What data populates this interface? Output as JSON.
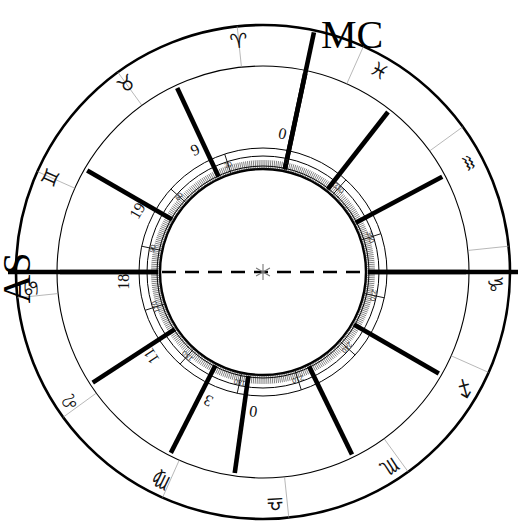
{
  "chart": {
    "type": "astrological-wheel",
    "center": {
      "x": 263,
      "y": 272,
      "marker": "asterisk"
    },
    "radii": {
      "outer_rim": 247,
      "zodiac_inner": 206,
      "house_ring_outer": 124,
      "degree_scale_outer": 116,
      "degree_scale_inner": 106,
      "inner_circle": 103
    },
    "axes": [
      {
        "name": "MC",
        "label": "MC",
        "angle_deg": 78,
        "position": "top"
      },
      {
        "name": "AS",
        "label": "AS",
        "angle_deg": 180,
        "position": "left"
      }
    ],
    "axis_line": {
      "name": "ascendant-descendant-axis",
      "style": "dashed",
      "from_angle_deg": 180,
      "to_angle_deg": 0
    },
    "zodiac_signs": [
      {
        "name": "aries",
        "glyph": "♈",
        "label": "Aries",
        "angle_deg": 96
      },
      {
        "name": "taurus",
        "glyph": "♉",
        "label": "Taurus",
        "angle_deg": 126
      },
      {
        "name": "gemini",
        "glyph": "♊",
        "label": "Gemini",
        "angle_deg": 156
      },
      {
        "name": "cancer",
        "glyph": "♋",
        "label": "Cancer",
        "angle_deg": 184
      },
      {
        "name": "leo",
        "glyph": "♌",
        "label": "Leo",
        "angle_deg": 214
      },
      {
        "name": "virgo",
        "glyph": "♍",
        "label": "Virgo",
        "angle_deg": 244
      },
      {
        "name": "libra",
        "glyph": "♎",
        "label": "Libra",
        "angle_deg": 273
      },
      {
        "name": "scorpio",
        "glyph": "♏",
        "label": "Scorpio",
        "angle_deg": 303
      },
      {
        "name": "sagittarius",
        "glyph": "♐",
        "label": "Sagittarius",
        "angle_deg": 330
      },
      {
        "name": "capricorn",
        "glyph": "♑",
        "label": "Capricorn",
        "angle_deg": 357
      },
      {
        "name": "aquarius",
        "glyph": "♒",
        "label": "Aquarius",
        "angle_deg": 28
      },
      {
        "name": "pisces",
        "glyph": "♓",
        "label": "Pisces",
        "angle_deg": 60
      }
    ],
    "sign_boundaries_deg": [
      6,
      36,
      66,
      96,
      126,
      156,
      186,
      216,
      246,
      276,
      306,
      336
    ],
    "house_cusps": [
      {
        "name": "cusp-mc",
        "angle_deg": 78,
        "number": "0",
        "bold": true
      },
      {
        "name": "cusp-2",
        "angle_deg": 115,
        "number": "9",
        "bold": true
      },
      {
        "name": "cusp-3",
        "angle_deg": 150,
        "number": "19",
        "bold": true
      },
      {
        "name": "cusp-as",
        "angle_deg": 180,
        "number": "18",
        "bold": true
      },
      {
        "name": "cusp-5",
        "angle_deg": 213,
        "number": "11",
        "bold": true
      },
      {
        "name": "cusp-6",
        "angle_deg": 243,
        "number": "3",
        "bold": true
      },
      {
        "name": "cusp-ic",
        "angle_deg": 262,
        "number": "0",
        "bold": true
      },
      {
        "name": "cusp-8",
        "angle_deg": 296,
        "number": "",
        "bold": true
      },
      {
        "name": "cusp-9",
        "angle_deg": 330,
        "number": "",
        "bold": true
      },
      {
        "name": "cusp-dc",
        "angle_deg": 0,
        "number": "",
        "bold": true
      },
      {
        "name": "cusp-11",
        "angle_deg": 28,
        "number": "",
        "bold": true
      },
      {
        "name": "cusp-12",
        "angle_deg": 52,
        "number": "",
        "bold": true
      }
    ],
    "degree_scale": {
      "major_step": 30,
      "minor_step": 1,
      "labels": [
        {
          "value": "30",
          "angle_deg": 108
        },
        {
          "value": "60",
          "angle_deg": 138
        },
        {
          "value": "90",
          "angle_deg": 168
        },
        {
          "value": "120",
          "angle_deg": 198
        },
        {
          "value": "150",
          "angle_deg": 228
        },
        {
          "value": "180",
          "angle_deg": 258
        },
        {
          "value": "210",
          "angle_deg": 288
        },
        {
          "value": "240",
          "angle_deg": 318
        },
        {
          "value": "270",
          "angle_deg": 348
        },
        {
          "value": "300",
          "angle_deg": 18
        },
        {
          "value": "330",
          "angle_deg": 48
        },
        {
          "value": "0",
          "angle_deg": 78
        }
      ]
    },
    "colors": {
      "stroke": "#000000",
      "background": "#ffffff",
      "divider": "#9a9a9a",
      "tick": "#1a1a1a"
    }
  }
}
